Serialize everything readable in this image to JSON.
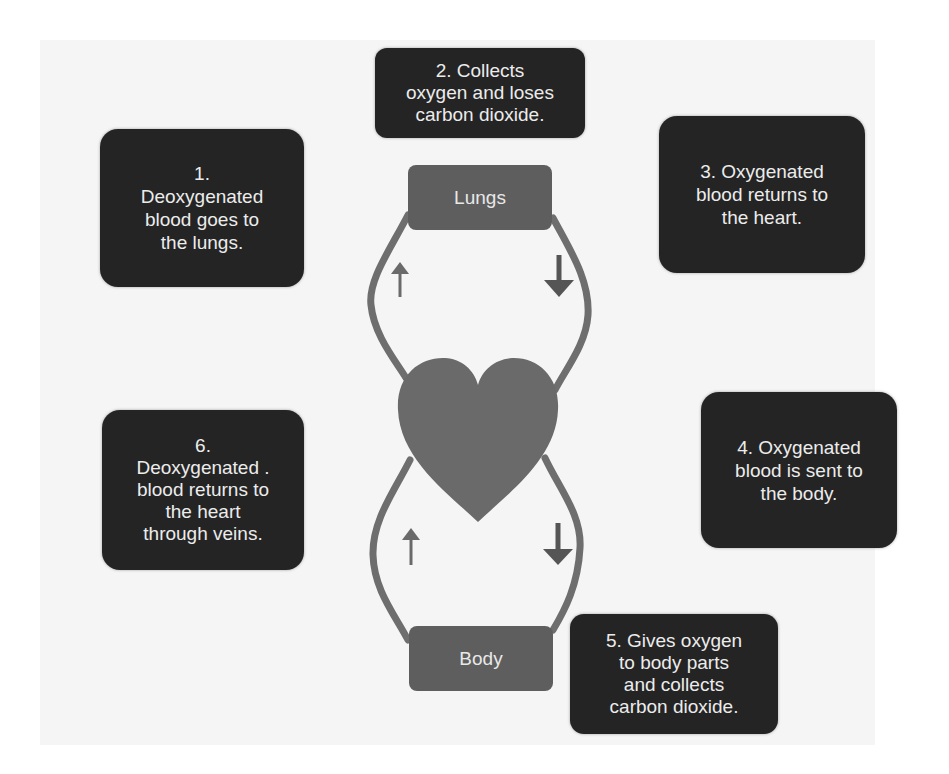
{
  "diagram": {
    "title": "",
    "type": "circulation-cycle",
    "colors": {
      "step_box": "#242424",
      "organ_box": "#5e5e5e",
      "heart": "#6a6a6a",
      "vessel": "#6e6e6e",
      "arrow": "#5a5a5a",
      "text": "#ececec",
      "panel": "#f5f5f5"
    },
    "organs": {
      "lungs": {
        "label": "Lungs"
      },
      "heart": {
        "label": "",
        "icon": "heart-icon"
      },
      "body": {
        "label": "Body"
      }
    },
    "steps": [
      {
        "number": 1,
        "text": "1.\nDeoxygenated\nblood goes to\nthe lungs."
      },
      {
        "number": 2,
        "text": "2. Collects\noxygen and loses\ncarbon dioxide."
      },
      {
        "number": 3,
        "text": "3. Oxygenated\nblood returns to\nthe heart."
      },
      {
        "number": 4,
        "text": "4. Oxygenated\nblood is sent to\nthe body."
      },
      {
        "number": 5,
        "text": "5. Gives oxygen\nto body parts\nand collects\ncarbon dioxide."
      },
      {
        "number": 6,
        "text": "6.\nDeoxygenated .\nblood returns to\nthe heart\nthrough veins."
      }
    ],
    "flow_arrows": [
      {
        "position": "upper-left",
        "direction": "up",
        "icon": "arrow-up-icon"
      },
      {
        "position": "upper-right",
        "direction": "down",
        "icon": "arrow-down-icon"
      },
      {
        "position": "lower-left",
        "direction": "up",
        "icon": "arrow-up-icon"
      },
      {
        "position": "lower-right",
        "direction": "down",
        "icon": "arrow-down-icon"
      }
    ]
  }
}
